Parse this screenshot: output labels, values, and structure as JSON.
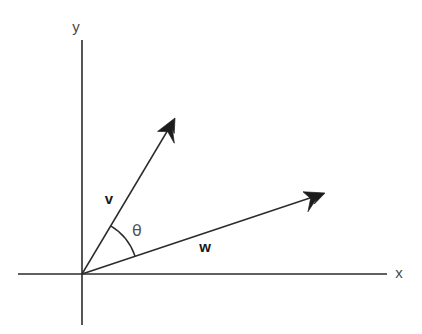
{
  "figure": {
    "background_color": "#ffffff",
    "stroke_color": "#2b2b2b",
    "label_color": "#4a4a4a",
    "width": 422,
    "height": 334
  },
  "axes": {
    "origin": {
      "x": 82,
      "y": 274
    },
    "x_axis": {
      "label": "x",
      "label_x": 399,
      "label_y": 278,
      "start_x": 18,
      "end_x": 387,
      "y": 274
    },
    "y_axis": {
      "label": "y",
      "label_x": 76,
      "label_y": 32,
      "start_y": 40,
      "end_y": 325,
      "x": 82
    }
  },
  "vectors": [
    {
      "name": "v",
      "label": "v",
      "label_x": 109,
      "label_y": 204,
      "tip_x": 175,
      "tip_y": 118,
      "angle_degrees": 59.2,
      "length_px": 181
    },
    {
      "name": "w",
      "label": "w",
      "label_x": 205,
      "label_y": 252,
      "tip_x": 325,
      "tip_y": 193,
      "angle_degrees": 18.4,
      "length_px": 256
    }
  ],
  "angle": {
    "symbol": "θ",
    "label_x": 131,
    "label_y": 236,
    "arc_radius": 56,
    "arc_start_x": 110.6,
    "arc_start_y": 225.9,
    "arc_end_x": 135.1,
    "arc_end_y": 256.3,
    "between": [
      "v",
      "w"
    ],
    "value_degrees": 40.8
  },
  "chart_data": {
    "type": "diagram",
    "xlabel": "x",
    "ylabel": "y",
    "annotations": [
      "v",
      "w",
      "θ"
    ],
    "series": [
      {
        "name": "v",
        "from": [
          0,
          0
        ],
        "to": [
          93,
          156
        ],
        "angle_deg": 59.2
      },
      {
        "name": "w",
        "from": [
          0,
          0
        ],
        "to": [
          243,
          81
        ],
        "angle_deg": 18.4
      }
    ]
  }
}
